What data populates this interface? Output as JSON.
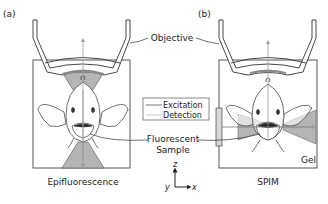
{
  "panels": [
    {
      "id": "a",
      "label": "(a)",
      "caption": "Epifluorescence"
    },
    {
      "id": "b",
      "label": "(b)",
      "caption": "SPIM"
    }
  ],
  "labels": {
    "objective": "Objective",
    "fluorescent_sample_line1": "Fluorescent",
    "fluorescent_sample_line2": "Sample",
    "gel": "Gel"
  },
  "legend": {
    "items": [
      {
        "label": "Excitation",
        "line_color": "#555555"
      },
      {
        "label": "Detection",
        "line_color": "#bbbbbb"
      }
    ]
  },
  "axes": {
    "z": "z",
    "y": "y",
    "x": "x"
  },
  "colors": {
    "stroke": "#333333",
    "light_fill": "#b5b5b5",
    "dark_fill": "#8a8a8a",
    "detection_line": "#999999"
  }
}
